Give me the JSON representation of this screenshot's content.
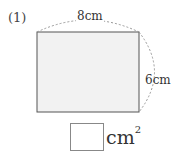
{
  "problem": {
    "number": "(1)",
    "width_label": "8cm",
    "height_label": "6cm",
    "answer_value": "",
    "answer_unit": "cm",
    "answer_unit_exponent": "2"
  },
  "colors": {
    "rect_fill": "#f2f2f2",
    "rect_stroke": "#555555",
    "dashed_arc": "#999999"
  }
}
